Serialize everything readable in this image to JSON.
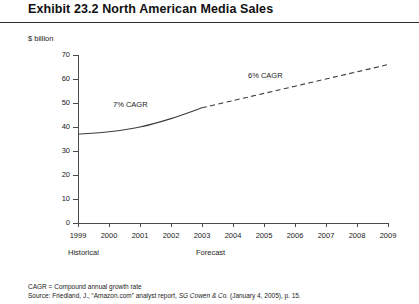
{
  "exhibit": {
    "title": "Exhibit 23.2  North American Media Sales",
    "units_label": "$ billion"
  },
  "footnotes": {
    "cagr_definition": "CAGR = Compound annual growth rate",
    "source_prefix": "Source: Friedland, J., “Amazon.com” analyst report, ",
    "source_italic": "SG Cowen & Co.",
    "source_suffix": " (January 4, 2005), p. 15."
  },
  "periods": {
    "historical_label": "Historical",
    "forecast_label": "Forecast"
  },
  "colors": {
    "line": "#3c3c3c",
    "axis": "#4a4a4a",
    "text": "#222222",
    "rule": "#2b2b2b"
  },
  "chart_data": {
    "type": "line",
    "title": "Exhibit 23.2  North American Media Sales",
    "xlabel": "",
    "ylabel": "$ billion",
    "ylim": [
      0,
      70
    ],
    "ytick_labels": [
      "0",
      "10",
      "20",
      "30",
      "40",
      "50",
      "60",
      "70"
    ],
    "ytick_values": [
      0,
      10,
      20,
      30,
      40,
      50,
      60,
      70
    ],
    "categories": [
      "1999",
      "2000",
      "2001",
      "2002",
      "2003",
      "2004",
      "2005",
      "2006",
      "2007",
      "2008",
      "2009"
    ],
    "x": [
      1999,
      2000,
      2001,
      2002,
      2003,
      2004,
      2005,
      2006,
      2007,
      2008,
      2009
    ],
    "grid": false,
    "legend": "none",
    "series": [
      {
        "name": "Historical",
        "style": "solid",
        "x": [
          1999,
          2000,
          2001,
          2002,
          2003
        ],
        "values": [
          37,
          38,
          40,
          43.5,
          48
        ]
      },
      {
        "name": "Forecast",
        "style": "dashed",
        "x": [
          2003,
          2004,
          2005,
          2006,
          2007,
          2008,
          2009
        ],
        "values": [
          48,
          51,
          54,
          57,
          60,
          63,
          66
        ]
      }
    ],
    "annotations": [
      {
        "text": "7% CAGR",
        "x": 2000.9,
        "y": 51
      },
      {
        "text": "6% CAGR",
        "x": 2005.3,
        "y": 63
      }
    ]
  }
}
